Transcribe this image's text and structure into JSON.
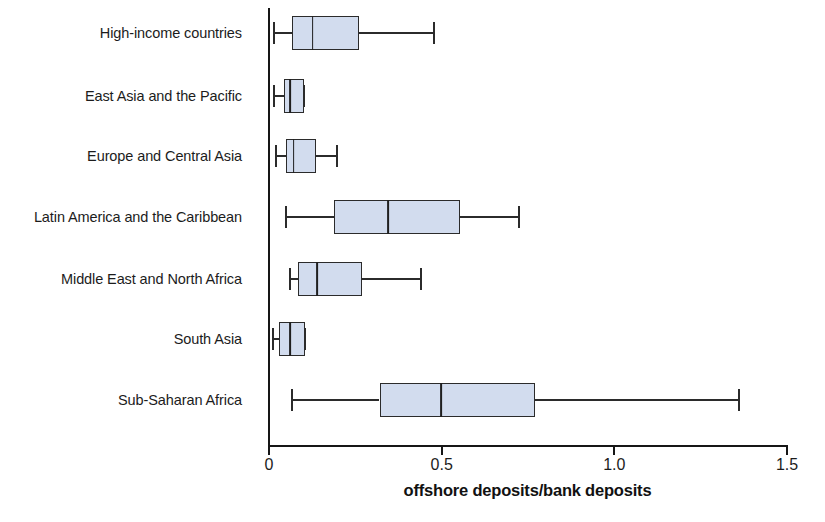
{
  "chart_data": {
    "type": "box",
    "title": "",
    "xlabel": "offshore deposits/bank deposits",
    "ylabel": "",
    "xlim": [
      0,
      1.5
    ],
    "xticks": [
      0,
      0.5,
      1.0,
      1.5
    ],
    "xtick_labels": [
      "0",
      "0.5",
      "1.0",
      "1.5"
    ],
    "grid": false,
    "legend": "none",
    "orientation": "horizontal",
    "categories": [
      "High-income countries",
      "East Asia and the Pacific",
      "Europe and Central Asia",
      "Latin America and the Caribbean",
      "Middle East and North Africa",
      "South Asia",
      "Sub-Saharan Africa"
    ],
    "boxes": [
      {
        "category": "High-income countries",
        "whisker_low": 0.015,
        "q1": 0.068,
        "median": 0.126,
        "q3": 0.26,
        "whisker_high": 0.479
      },
      {
        "category": "East Asia and the Pacific",
        "whisker_low": 0.015,
        "q1": 0.044,
        "median": 0.062,
        "q3": 0.102,
        "whisker_high": 0.102
      },
      {
        "category": "Europe and Central Asia",
        "whisker_low": 0.021,
        "q1": 0.05,
        "median": 0.071,
        "q3": 0.136,
        "whisker_high": 0.197
      },
      {
        "category": "Latin America and the Caribbean",
        "whisker_low": 0.049,
        "q1": 0.188,
        "median": 0.345,
        "q3": 0.554,
        "whisker_high": 0.723
      },
      {
        "category": "Middle East and North Africa",
        "whisker_low": 0.062,
        "q1": 0.084,
        "median": 0.139,
        "q3": 0.268,
        "whisker_high": 0.441
      },
      {
        "category": "South Asia",
        "whisker_low": 0.012,
        "q1": 0.03,
        "median": 0.062,
        "q3": 0.105,
        "whisker_high": 0.105
      },
      {
        "category": "Sub-Saharan Africa",
        "whisker_low": 0.067,
        "q1": 0.32,
        "median": 0.499,
        "q3": 0.769,
        "whisker_high": 1.36
      }
    ],
    "colors": {
      "box_fill": "#d2dcee",
      "box_border": "#2b2b2b",
      "whisker": "#2b2b2b",
      "median": "#1f1f1f",
      "axis": "#161616",
      "text": "#1c1c1c"
    }
  },
  "layout": {
    "plot_left_px": 269,
    "plot_right_px": 787,
    "axis_top_px": 8,
    "axis_bottom_px": 445,
    "row_centers_px": [
      33,
      96,
      156,
      217,
      279,
      339,
      400
    ],
    "box_height_px": 34,
    "cap_height_px": 22
  }
}
